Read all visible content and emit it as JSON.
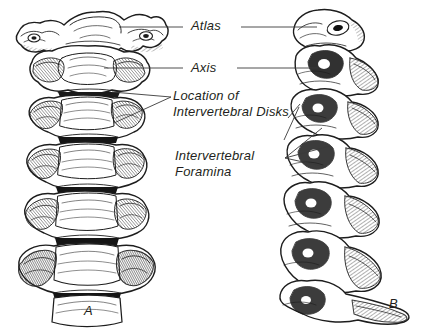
{
  "figure": {
    "background_color": "#ffffff",
    "ink_color": "#231f20",
    "width": 421,
    "height": 333
  },
  "labels": {
    "atlas": "Atlas",
    "axis": "Axis",
    "disks_line1": "Location of",
    "disks_line2": "Intervertebral Disks",
    "foramina_line1": "Intervertebral",
    "foramina_line2": "Foramina"
  },
  "panels": {
    "a": {
      "letter": "A",
      "view": "anterior view of cervical spine"
    },
    "b": {
      "letter": "B",
      "view": "lateral view of cervical spine"
    }
  }
}
